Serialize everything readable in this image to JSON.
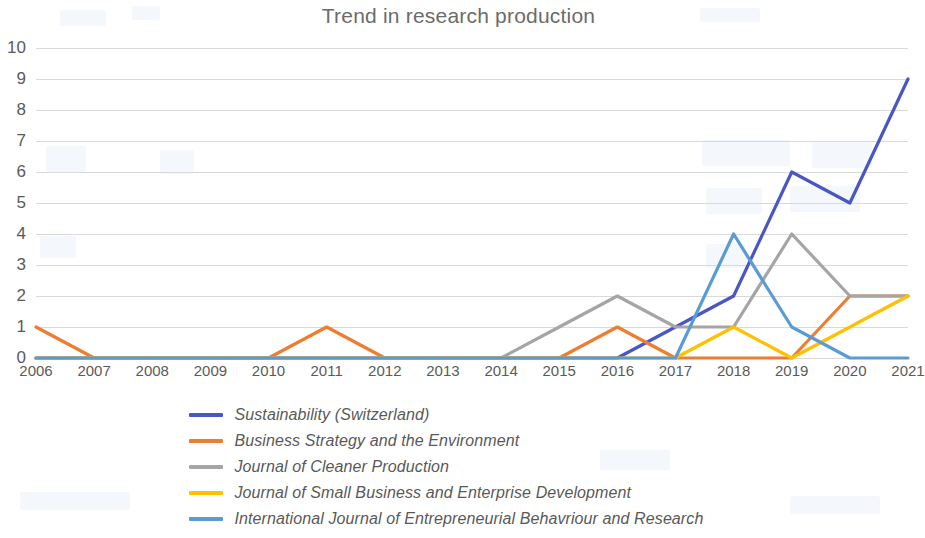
{
  "chart_data": {
    "type": "line",
    "title": "Trend in research production",
    "xlabel": "",
    "ylabel": "",
    "categories": [
      "2006",
      "2007",
      "2008",
      "2009",
      "2010",
      "2011",
      "2012",
      "2013",
      "2014",
      "2015",
      "2016",
      "2017",
      "2018",
      "2019",
      "2020",
      "2021"
    ],
    "ylim": [
      0,
      10
    ],
    "yticks": [
      0,
      1,
      2,
      3,
      4,
      5,
      6,
      7,
      8,
      9,
      10
    ],
    "grid": true,
    "legend_position": "bottom",
    "series": [
      {
        "name": "Sustainability (Switzerland)",
        "color": "#4A56C4",
        "values": [
          0,
          0,
          0,
          0,
          0,
          0,
          0,
          0,
          0,
          0,
          0,
          1,
          2,
          6,
          5,
          9
        ]
      },
      {
        "name": "Business Strategy and the Environment",
        "color": "#ED7D31",
        "values": [
          1,
          0,
          0,
          0,
          0,
          1,
          0,
          0,
          0,
          0,
          1,
          0,
          0,
          0,
          2,
          2
        ]
      },
      {
        "name": "Journal of Cleaner Production",
        "color": "#A5A5A5",
        "values": [
          0,
          0,
          0,
          0,
          0,
          0,
          0,
          0,
          0,
          1,
          2,
          1,
          1,
          4,
          2,
          2
        ]
      },
      {
        "name": "Journal of Small Business and Enterprise Development",
        "color": "#FFC000",
        "values": [
          0,
          0,
          0,
          0,
          0,
          0,
          0,
          0,
          0,
          0,
          0,
          0,
          1,
          0,
          1,
          2
        ]
      },
      {
        "name": "International Journal of Entrepreneurial Behavriour and Research",
        "color": "#5B9BD5",
        "values": [
          0,
          0,
          0,
          0,
          0,
          0,
          0,
          0,
          0,
          0,
          0,
          0,
          4,
          1,
          0,
          0
        ]
      }
    ]
  }
}
